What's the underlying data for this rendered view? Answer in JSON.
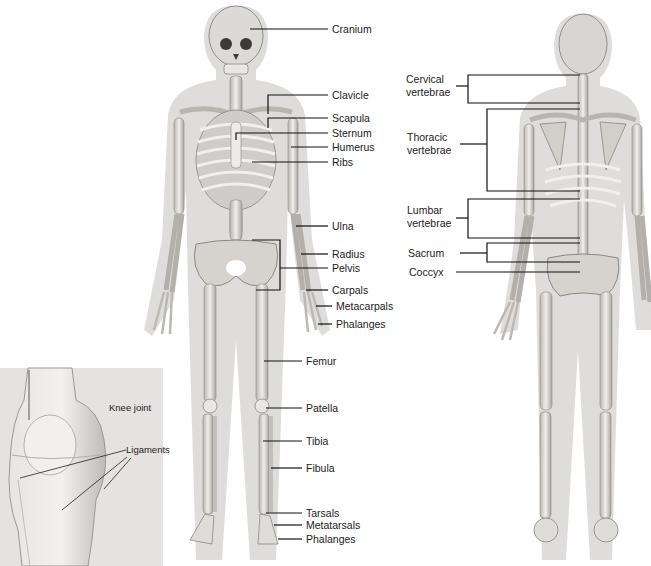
{
  "diagram": {
    "type": "anatomical skeleton diagram",
    "front_view": {
      "labels": [
        {
          "id": "cranium",
          "text": "Cranium",
          "y": 29
        },
        {
          "id": "clavicle",
          "text": "Clavicle",
          "y": 95
        },
        {
          "id": "scapula",
          "text": "Scapula",
          "y": 118
        },
        {
          "id": "sternum",
          "text": "Sternum",
          "y": 133
        },
        {
          "id": "humerus",
          "text": "Humerus",
          "y": 147
        },
        {
          "id": "ribs",
          "text": "Ribs",
          "y": 162
        },
        {
          "id": "ulna",
          "text": "Ulna",
          "y": 226
        },
        {
          "id": "radius",
          "text": "Radius",
          "y": 254
        },
        {
          "id": "pelvis",
          "text": "Pelvis",
          "y": 268
        },
        {
          "id": "carpals",
          "text": "Carpals",
          "y": 290
        },
        {
          "id": "metacarpals",
          "text": "Metacarpals",
          "y": 306
        },
        {
          "id": "phalanges_hand",
          "text": "Phalanges",
          "y": 324
        },
        {
          "id": "femur",
          "text": "Femur",
          "y": 361
        },
        {
          "id": "patella",
          "text": "Patella",
          "y": 408
        },
        {
          "id": "tibia",
          "text": "Tibia",
          "y": 441
        },
        {
          "id": "fibula",
          "text": "Fibula",
          "y": 468
        },
        {
          "id": "tarsals",
          "text": "Tarsals",
          "y": 513
        },
        {
          "id": "metatarsals",
          "text": "Metatarsals",
          "y": 525
        },
        {
          "id": "phalanges_foot",
          "text": "Phalanges",
          "y": 539
        }
      ]
    },
    "back_view": {
      "labels": [
        {
          "id": "cervical",
          "text": "Cervical\nvertebrae"
        },
        {
          "id": "thoracic",
          "text": "Thoracic\nvertebrae"
        },
        {
          "id": "lumbar",
          "text": "Lumbar\nvertebrae"
        },
        {
          "id": "sacrum",
          "text": "Sacrum"
        },
        {
          "id": "coccyx",
          "text": "Coccyx"
        }
      ]
    },
    "inset": {
      "title": "Knee joint",
      "label": "Ligaments"
    },
    "colors": {
      "bone": "#e8e6e2",
      "bone_shade": "#9a9794",
      "body_silhouette": "#d6d4d2",
      "leader_line": "#111111",
      "inset_bg": "#e4e3e1"
    }
  }
}
